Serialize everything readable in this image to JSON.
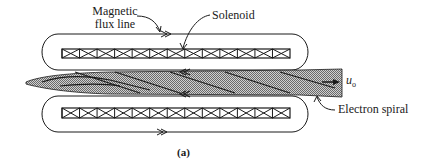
{
  "figure": {
    "caption": "(a)",
    "labels": {
      "magnetic_flux_line_1": "Magnetic",
      "magnetic_flux_line_2": "flux line",
      "solenoid": "Solenoid",
      "electron_spiral": "Electron spiral",
      "velocity_symbol": "u",
      "velocity_subscript": "o"
    },
    "solenoid_cells_per_coil": 13,
    "colors": {
      "line": "#1a1a1a",
      "beam_fill": "#a8a8a8",
      "background": "#ffffff"
    }
  }
}
